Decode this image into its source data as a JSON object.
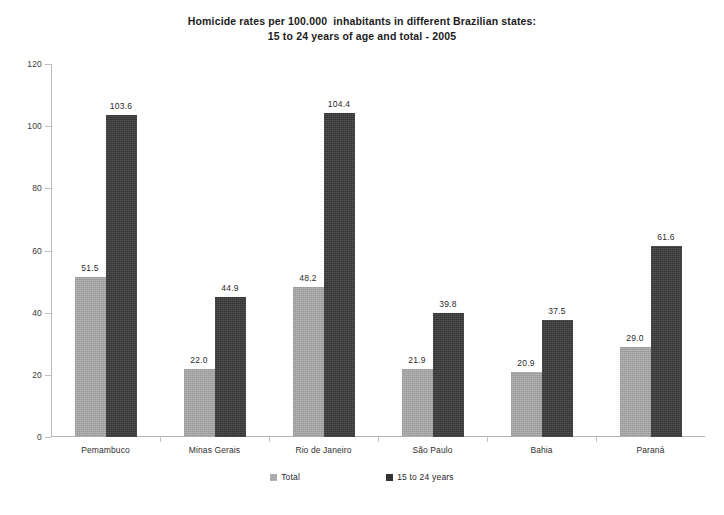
{
  "chart_data": {
    "type": "bar",
    "title": "Homicide rates per 100.000  inhabitants in different Brazilian states:\n15 to 24 years of age and total - 2005",
    "title_line1": "Homicide rates per 100.000  inhabitants in different Brazilian states:",
    "title_line2": "15 to 24 years of age and total - 2005",
    "xlabel": "",
    "ylabel": "",
    "ylim": [
      0,
      120
    ],
    "yticks": [
      0,
      20,
      40,
      60,
      80,
      100,
      120
    ],
    "ytick_labels": [
      "0",
      "20",
      "40",
      "60",
      "80",
      "100",
      "120"
    ],
    "grid": false,
    "legend_position": "bottom-center",
    "categories": [
      "Pemambuco",
      "Minas Gerais",
      "Rio de Janeiro",
      "São Paulo",
      "Bahia",
      "Paraná"
    ],
    "series": [
      {
        "name": "Total",
        "color": "#a3a3a3",
        "values": [
          51.5,
          22.0,
          48.2,
          21.9,
          20.9,
          29.0
        ],
        "value_labels": [
          "51.5",
          "22.0",
          "48.2",
          "21.9",
          "20.9",
          "29.0"
        ]
      },
      {
        "name": "15 to 24 years",
        "color": "#333333",
        "values": [
          103.6,
          44.9,
          104.4,
          39.8,
          37.5,
          61.6
        ],
        "value_labels": [
          "103.6",
          "44.9",
          "104.4",
          "39.8",
          "37.5",
          "61.6"
        ]
      }
    ]
  },
  "legend": {
    "items": [
      {
        "label": "Total",
        "swatch": "total"
      },
      {
        "label": "15 to 24 years",
        "swatch": "youth"
      }
    ]
  },
  "colors": {
    "background": "#ffffff",
    "axis": "#b9b9b9",
    "text": "#2b2b2b",
    "series_total": "#a3a3a3",
    "series_youth": "#333333"
  }
}
